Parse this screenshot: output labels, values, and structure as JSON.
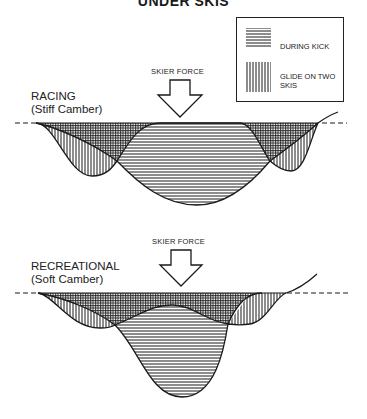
{
  "title": "UNDER SKIS",
  "legend": {
    "items": [
      {
        "label": "DURING KICK",
        "pattern": "horizontal-hatch"
      },
      {
        "label": "GLIDE ON TWO",
        "label_line2": "SKIS",
        "pattern": "vertical-hatch"
      }
    ]
  },
  "diagrams": [
    {
      "label": "RACING",
      "sublabel": "(Stiff Camber)",
      "force_label": "SKIER FORCE"
    },
    {
      "label": "RECREATIONAL",
      "sublabel": "(Soft Camber)",
      "force_label": "SKIER FORCE"
    }
  ],
  "colors": {
    "ink": "#1a1a1a",
    "background": "#ffffff"
  }
}
